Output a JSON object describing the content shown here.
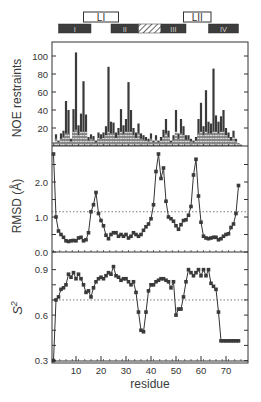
{
  "chart_data": [
    {
      "type": "bar",
      "panel": "top",
      "ylabel": "NOE restraints",
      "yticks": [
        20,
        40,
        60,
        80,
        100
      ],
      "ylim": [
        0,
        115
      ],
      "xlabel": "residue",
      "xlim": [
        0,
        78
      ],
      "description": "Stacked bars per residue (dark total / hatched lighter component)",
      "residues": [
        1,
        2,
        3,
        4,
        5,
        6,
        7,
        8,
        9,
        10,
        11,
        12,
        13,
        14,
        15,
        16,
        17,
        18,
        19,
        20,
        21,
        22,
        23,
        24,
        25,
        26,
        27,
        28,
        29,
        30,
        31,
        32,
        33,
        34,
        35,
        36,
        37,
        38,
        39,
        40,
        41,
        42,
        43,
        44,
        45,
        46,
        47,
        48,
        49,
        50,
        51,
        52,
        53,
        54,
        55,
        56,
        57,
        58,
        59,
        60,
        61,
        62,
        63,
        64,
        65,
        66,
        67,
        68,
        69,
        70,
        71,
        72,
        73,
        74,
        75,
        76
      ],
      "values": [
        4,
        13,
        6,
        14,
        17,
        50,
        40,
        8,
        41,
        104,
        23,
        36,
        72,
        35,
        10,
        13,
        11,
        6,
        15,
        13,
        15,
        22,
        88,
        27,
        26,
        15,
        20,
        41,
        23,
        30,
        71,
        40,
        20,
        15,
        25,
        14,
        12,
        10,
        8,
        14,
        6,
        12,
        6,
        10,
        18,
        30,
        17,
        6,
        12,
        40,
        14,
        30,
        22,
        12,
        12,
        8,
        6,
        10,
        30,
        48,
        22,
        62,
        27,
        25,
        86,
        34,
        27,
        33,
        40,
        20,
        15,
        10,
        17,
        8,
        3,
        1
      ],
      "light_values": [
        3,
        8,
        4,
        8,
        10,
        14,
        14,
        5,
        16,
        18,
        12,
        16,
        16,
        16,
        6,
        8,
        7,
        4,
        9,
        8,
        9,
        12,
        16,
        14,
        14,
        9,
        12,
        16,
        13,
        16,
        16,
        16,
        12,
        9,
        14,
        8,
        7,
        6,
        5,
        8,
        4,
        7,
        4,
        6,
        10,
        14,
        10,
        4,
        7,
        16,
        8,
        14,
        12,
        7,
        7,
        5,
        4,
        6,
        14,
        16,
        12,
        16,
        14,
        14,
        16,
        16,
        14,
        16,
        16,
        12,
        9,
        6,
        10,
        5,
        2,
        1
      ]
    },
    {
      "type": "line",
      "panel": "middle",
      "ylabel": "RMSD (Å)",
      "yticks": [
        0.0,
        1.0,
        2.0
      ],
      "ylim": [
        0,
        3.0
      ],
      "reference_line": 1.15,
      "xlabel": "residue",
      "x": [
        1,
        2,
        3,
        4,
        5,
        6,
        7,
        8,
        9,
        10,
        11,
        12,
        13,
        14,
        15,
        16,
        17,
        18,
        19,
        20,
        21,
        22,
        23,
        24,
        25,
        26,
        27,
        28,
        29,
        30,
        31,
        32,
        33,
        34,
        35,
        36,
        37,
        38,
        39,
        40,
        41,
        42,
        43,
        44,
        45,
        46,
        47,
        48,
        49,
        50,
        51,
        52,
        53,
        54,
        55,
        56,
        57,
        58,
        59,
        60,
        61,
        62,
        63,
        64,
        65,
        66,
        67,
        68,
        69,
        70,
        71,
        72,
        73,
        74,
        75
      ],
      "values": [
        2.8,
        1.0,
        0.6,
        0.5,
        0.42,
        0.32,
        0.3,
        0.32,
        0.33,
        0.32,
        0.4,
        0.42,
        0.32,
        0.35,
        0.55,
        1.15,
        1.35,
        1.7,
        1.1,
        0.9,
        0.75,
        0.48,
        0.38,
        0.5,
        0.55,
        0.55,
        0.45,
        0.5,
        0.45,
        0.5,
        0.4,
        0.45,
        0.55,
        0.5,
        0.45,
        0.5,
        0.62,
        0.72,
        0.8,
        0.95,
        1.35,
        2.3,
        2.8,
        2.1,
        2.4,
        1.45,
        1.0,
        0.95,
        0.88,
        0.75,
        0.65,
        0.78,
        0.9,
        0.92,
        1.05,
        1.3,
        2.2,
        2.65,
        1.6,
        0.85,
        0.45,
        0.4,
        0.38,
        0.4,
        0.42,
        0.42,
        0.35,
        0.38,
        0.45,
        0.5,
        0.52,
        0.7,
        0.8,
        1.1,
        1.9
      ]
    },
    {
      "type": "line",
      "panel": "bottom",
      "ylabel": "S²",
      "yticks": [
        0.3,
        0.6,
        0.9
      ],
      "ylim": [
        0.28,
        0.97
      ],
      "reference_line": 0.7,
      "xlabel": "residue",
      "xticks": [
        10,
        20,
        30,
        40,
        50,
        60,
        70
      ],
      "x": [
        1,
        2,
        3,
        4,
        5,
        6,
        7,
        8,
        9,
        10,
        11,
        12,
        13,
        14,
        15,
        16,
        17,
        18,
        19,
        20,
        21,
        22,
        23,
        24,
        25,
        26,
        27,
        28,
        29,
        30,
        31,
        32,
        33,
        34,
        35,
        36,
        37,
        38,
        39,
        40,
        41,
        42,
        43,
        44,
        45,
        46,
        47,
        48,
        49,
        50,
        51,
        52,
        53,
        54,
        55,
        56,
        57,
        58,
        59,
        60,
        61,
        62,
        63,
        64,
        65,
        66,
        67,
        68,
        69,
        70,
        71,
        72,
        73,
        74,
        75
      ],
      "values": [
        0.3,
        0.7,
        0.72,
        0.77,
        0.78,
        0.8,
        0.87,
        0.85,
        0.88,
        0.84,
        0.87,
        0.84,
        0.8,
        0.75,
        0.76,
        0.72,
        0.78,
        0.82,
        0.84,
        0.85,
        0.84,
        0.86,
        0.88,
        0.87,
        0.92,
        0.86,
        0.85,
        0.83,
        0.84,
        0.84,
        0.82,
        0.8,
        0.82,
        0.75,
        0.62,
        0.5,
        0.49,
        0.62,
        0.76,
        0.8,
        0.8,
        0.82,
        0.83,
        0.84,
        0.84,
        0.83,
        0.82,
        0.78,
        0.82,
        0.6,
        0.64,
        0.64,
        0.72,
        0.82,
        0.9,
        0.88,
        0.86,
        0.88,
        0.9,
        0.86,
        0.9,
        0.86,
        0.9,
        0.81,
        0.79,
        0.77,
        0.62,
        0.43,
        0.43,
        0.43,
        0.43,
        0.43,
        0.43,
        0.43,
        0.43
      ]
    }
  ],
  "secondary_structure": {
    "loops": [
      {
        "label": "LI",
        "start": 13,
        "end": 27
      },
      {
        "label": "LII",
        "start": 53,
        "end": 64
      }
    ],
    "elements": [
      {
        "label": "I",
        "start": 3,
        "end": 16,
        "style": "solid"
      },
      {
        "label": "II",
        "start": 24,
        "end": 35,
        "style": "solid"
      },
      {
        "label": "",
        "start": 35,
        "end": 44,
        "style": "hatched"
      },
      {
        "label": "III",
        "start": 44,
        "end": 54,
        "style": "solid"
      },
      {
        "label": "IV",
        "start": 63,
        "end": 75,
        "style": "solid"
      }
    ]
  },
  "labels": {
    "noe_ylabel": "NOE restraints",
    "rmsd_ylabel": "RMSD (Å)",
    "s2_ylabel": "S",
    "s2_sup": "2",
    "xlabel": "residue"
  },
  "colors": {
    "bar_dark": "#3a3a3a",
    "bar_light": "#9a9a9a",
    "marker": "#3a3a3a",
    "axis": "#333333",
    "box_fill": "#3d3d3d"
  }
}
